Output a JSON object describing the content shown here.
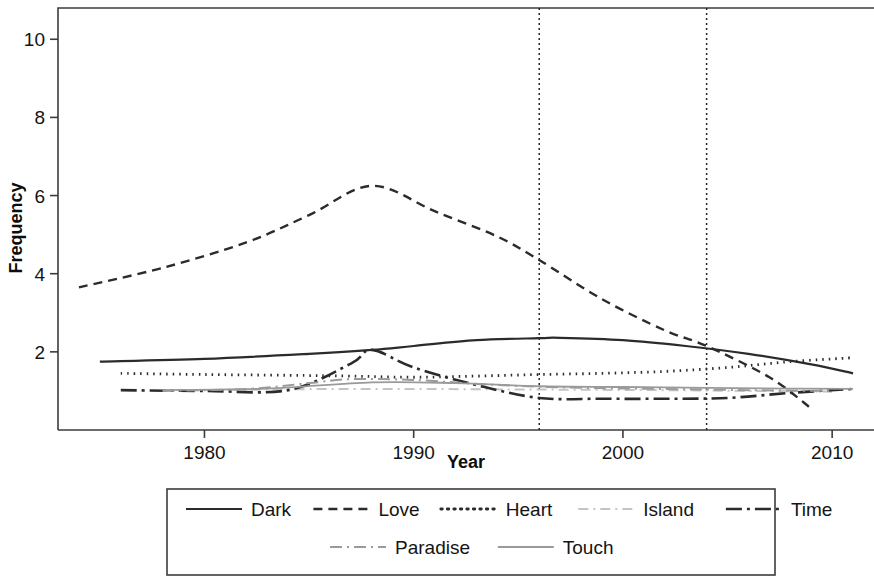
{
  "chart_data": {
    "type": "line",
    "title": "",
    "xlabel": "Year",
    "ylabel": "Frequency",
    "xlim": [
      1973,
      2012
    ],
    "ylim": [
      0,
      10.8
    ],
    "xticks": [
      1980,
      1990,
      2000,
      2010
    ],
    "xtick_labels": [
      "1980",
      "1990",
      "2000",
      "2010"
    ],
    "yticks": [
      2,
      4,
      6,
      8,
      10
    ],
    "ytick_labels": [
      "2",
      "4",
      "6",
      "8",
      "10"
    ],
    "grid": false,
    "legend_position": "below",
    "annotations": {
      "vertical_reference_lines": [
        1996,
        2004
      ],
      "vline_style": "dotted"
    },
    "series": [
      {
        "name": "Dark",
        "style": "solid",
        "color": "#2b2b2b",
        "x": [
          1975,
          1980,
          1985,
          1988,
          1990,
          1993,
          1996,
          1997,
          2000,
          2003,
          2006,
          2009,
          2011
        ],
        "y": [
          1.75,
          1.82,
          1.95,
          2.05,
          2.15,
          2.3,
          2.35,
          2.36,
          2.3,
          2.15,
          1.95,
          1.68,
          1.45
        ]
      },
      {
        "name": "Love",
        "style": "dashed",
        "color": "#2b2b2b",
        "x": [
          1974,
          1978,
          1982,
          1985,
          1988,
          1991,
          1994,
          1996,
          1999,
          2002,
          2004,
          2007,
          2009
        ],
        "y": [
          3.65,
          4.15,
          4.8,
          5.5,
          6.25,
          5.6,
          4.95,
          4.35,
          3.35,
          2.55,
          2.15,
          1.35,
          0.55
        ]
      },
      {
        "name": "Heart",
        "style": "dotted",
        "color": "#2b2b2b",
        "x": [
          1976,
          1980,
          1984,
          1987,
          1990,
          1993,
          1996,
          1999,
          2002,
          2005,
          2008,
          2011
        ],
        "y": [
          1.45,
          1.42,
          1.4,
          1.38,
          1.35,
          1.38,
          1.42,
          1.45,
          1.5,
          1.6,
          1.75,
          1.85
        ]
      },
      {
        "name": "Island",
        "style": "light-dashdot",
        "color": "#c4c4c4",
        "x": [
          1978,
          1982,
          1986,
          1990,
          1994,
          1998,
          2002,
          2006,
          2010
        ],
        "y": [
          1.02,
          1.03,
          1.05,
          1.05,
          1.04,
          1.03,
          1.02,
          1.0,
          0.98
        ]
      },
      {
        "name": "Time",
        "style": "longdash-dot",
        "color": "#2b2b2b",
        "x": [
          1976,
          1980,
          1984,
          1987,
          1988,
          1990,
          1993,
          1996,
          1999,
          2002,
          2005,
          2008,
          2011
        ],
        "y": [
          1.02,
          1.0,
          1.02,
          1.7,
          2.05,
          1.6,
          1.15,
          0.82,
          0.8,
          0.8,
          0.82,
          0.95,
          1.05
        ]
      },
      {
        "name": "Paradise",
        "style": "grey-dashdot",
        "color": "#9a9a9a",
        "x": [
          1978,
          1982,
          1985,
          1987,
          1990,
          1994,
          1998,
          2002,
          2006,
          2010
        ],
        "y": [
          1.0,
          1.05,
          1.2,
          1.3,
          1.28,
          1.15,
          1.08,
          1.05,
          1.02,
          1.0
        ]
      },
      {
        "name": "Touch",
        "style": "grey-solid",
        "color": "#9a9a9a",
        "x": [
          1978,
          1983,
          1988,
          1992,
          1996,
          2000,
          2004,
          2008,
          2011
        ],
        "y": [
          1.02,
          1.06,
          1.22,
          1.2,
          1.12,
          1.1,
          1.08,
          1.06,
          1.05
        ]
      }
    ]
  },
  "axes": {
    "ylabel": "Frequency",
    "xlabel": "Year"
  },
  "legend": {
    "rows": [
      [
        {
          "label": "Dark",
          "style": "solid",
          "color": "#2b2b2b"
        },
        {
          "label": "Love",
          "style": "dashed",
          "color": "#2b2b2b"
        },
        {
          "label": "Heart",
          "style": "dotted",
          "color": "#2b2b2b"
        },
        {
          "label": "Island",
          "style": "light-dashdot",
          "color": "#c4c4c4"
        },
        {
          "label": "Time",
          "style": "longdash-dot",
          "color": "#2b2b2b"
        }
      ],
      [
        {
          "label": "Paradise",
          "style": "grey-dashdot",
          "color": "#9a9a9a"
        },
        {
          "label": "Touch",
          "style": "grey-solid",
          "color": "#9a9a9a"
        }
      ]
    ]
  }
}
